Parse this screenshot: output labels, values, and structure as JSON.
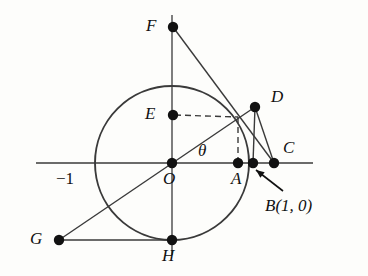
{
  "figure": {
    "colors": {
      "stroke": "#3a3a3a",
      "point": "#111111",
      "label": "#111111",
      "background": "#fdfdfb"
    },
    "circle": {
      "cx": 172,
      "cy": 163,
      "r": 77,
      "label": "unit-circle"
    },
    "axes": {
      "x_axis": {
        "x1": 36,
        "y1": 163,
        "x2": 313,
        "y2": 163
      },
      "y_axis": {
        "x1": 172,
        "y1": 15,
        "x2": 172,
        "y2": 255
      }
    },
    "angle": {
      "symbol": "θ",
      "x": 198,
      "y": 142
    },
    "tick": {
      "label": "−1",
      "x": 56,
      "y": 170
    },
    "points": [
      {
        "name": "F",
        "x": 173,
        "y": 27,
        "label": "F",
        "label_x": 146,
        "label_y": 17
      },
      {
        "name": "D",
        "x": 255,
        "y": 107,
        "label": "D",
        "label_x": 271,
        "label_y": 88
      },
      {
        "name": "E",
        "x": 173,
        "y": 115,
        "label": "E",
        "label_x": 145,
        "label_y": 105
      },
      {
        "name": "C",
        "x": 274,
        "y": 163,
        "label": "C",
        "label_x": 283,
        "label_y": 139
      },
      {
        "name": "B",
        "x": 253,
        "y": 163,
        "label": "B(1, 0)",
        "label_x": 265,
        "label_y": 197
      },
      {
        "name": "A",
        "x": 238,
        "y": 163,
        "label": "A",
        "label_x": 231,
        "label_y": 170
      },
      {
        "name": "O",
        "x": 172,
        "y": 163,
        "label": "O",
        "label_x": 163,
        "label_y": 170
      },
      {
        "name": "G",
        "x": 59,
        "y": 240,
        "label": "G",
        "label_x": 30,
        "label_y": 230
      },
      {
        "name": "H",
        "x": 172,
        "y": 240,
        "label": "H",
        "label_x": 162,
        "label_y": 247
      }
    ],
    "solid_segments": [
      {
        "name": "F-to-C",
        "x1": 173,
        "y1": 27,
        "x2": 274,
        "y2": 163
      },
      {
        "name": "D-to-B",
        "x1": 255,
        "y1": 107,
        "x2": 253,
        "y2": 163
      },
      {
        "name": "D-to-C",
        "x1": 255,
        "y1": 107,
        "x2": 274,
        "y2": 163
      },
      {
        "name": "G-to-D",
        "x1": 59,
        "y1": 240,
        "x2": 255,
        "y2": 107
      },
      {
        "name": "G-to-H",
        "x1": 59,
        "y1": 240,
        "x2": 172,
        "y2": 240
      }
    ],
    "dashed_segments": [
      {
        "name": "E-to-tangent-point",
        "x1": 175,
        "y1": 115,
        "x2": 238,
        "y2": 117
      },
      {
        "name": "tangent-point-to-A",
        "x1": 238,
        "y1": 117,
        "x2": 238,
        "y2": 161
      }
    ],
    "pointer_arrow": {
      "name": "arrow-to-B",
      "tail_x": 283,
      "tail_y": 191,
      "head_x": 256,
      "head_y": 170
    }
  }
}
